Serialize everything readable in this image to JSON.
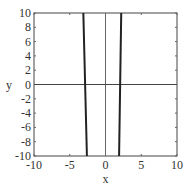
{
  "chart_data": {
    "type": "line",
    "title": "",
    "xlabel": "x",
    "ylabel": "y",
    "xlim": [
      -10,
      10
    ],
    "ylim": [
      -10,
      10
    ],
    "xticks": [
      "-10",
      "-5",
      "0",
      "5",
      "10"
    ],
    "yticks": [
      "10",
      "8",
      "6",
      "4",
      "2",
      "0",
      "-2",
      "-4",
      "-6",
      "-8",
      "-10"
    ],
    "grid": false,
    "series": [
      {
        "name": "curve-left",
        "x": [
          -3.1,
          -2.6
        ],
        "y": [
          10,
          -10
        ]
      },
      {
        "name": "curve-right",
        "x": [
          2.2,
          1.9
        ],
        "y": [
          10,
          -10
        ]
      }
    ],
    "reference_lines": {
      "x0": 0,
      "y0": 0
    }
  }
}
